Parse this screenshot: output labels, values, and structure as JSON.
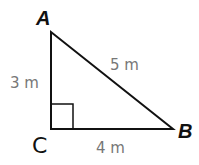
{
  "figure": {
    "type": "right-triangle",
    "vertices": {
      "A": {
        "label": "A"
      },
      "B": {
        "label": "B"
      },
      "C": {
        "label": "C"
      }
    },
    "sides": {
      "AC": {
        "label": "3 m",
        "value": 3,
        "unit": "m"
      },
      "CB": {
        "label": "4 m",
        "value": 4,
        "unit": "m"
      },
      "AB": {
        "label": "5 m",
        "value": 5,
        "unit": "m"
      }
    },
    "right_angle_at": "C",
    "colors": {
      "stroke": "#111111",
      "vertex_label": "#111111",
      "measure_label": "#777777",
      "background": "#ffffff"
    }
  }
}
